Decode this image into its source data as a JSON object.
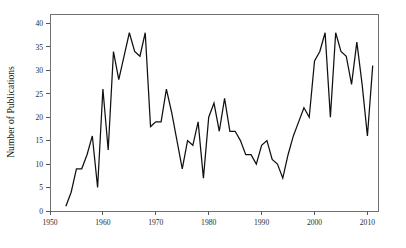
{
  "chart_data": {
    "type": "line",
    "title": "",
    "subtitle": "",
    "xlabel": "",
    "ylabel": "Number of Publications",
    "xlim": [
      1950,
      2012
    ],
    "ylim": [
      0,
      42
    ],
    "xticks": [
      1950,
      1960,
      1970,
      1980,
      1990,
      2000,
      2010
    ],
    "yticks": [
      0,
      5,
      10,
      15,
      20,
      25,
      30,
      35,
      40
    ],
    "xtick_labels": [
      "1950",
      "1960",
      "1970",
      "1980",
      "1990",
      "2000",
      "2010"
    ],
    "ytick_labels": [
      "0",
      "5",
      "10",
      "15",
      "20",
      "25",
      "30",
      "35",
      "40"
    ],
    "grid": false,
    "legend": false,
    "legend_position": "none",
    "line_color": "#101010",
    "series": [
      {
        "name": "Number of Publications",
        "x": [
          1953,
          1954,
          1955,
          1956,
          1957,
          1958,
          1959,
          1960,
          1961,
          1962,
          1963,
          1964,
          1965,
          1966,
          1967,
          1968,
          1969,
          1970,
          1971,
          1972,
          1973,
          1974,
          1975,
          1976,
          1977,
          1978,
          1979,
          1980,
          1981,
          1982,
          1983,
          1984,
          1985,
          1986,
          1987,
          1988,
          1989,
          1990,
          1991,
          1992,
          1993,
          1994,
          1995,
          1996,
          1997,
          1998,
          1999,
          2000,
          2001,
          2002,
          2003,
          2004,
          2005,
          2006,
          2007,
          2008,
          2009,
          2010,
          2011
        ],
        "values": [
          1,
          4,
          9,
          9,
          12,
          16,
          5,
          26,
          13,
          34,
          28,
          33,
          38,
          34,
          33,
          38,
          18,
          19,
          19,
          26,
          21,
          15,
          9,
          15,
          14,
          19,
          7,
          20,
          23,
          17,
          24,
          17,
          17,
          15,
          12,
          12,
          10,
          14,
          15,
          11,
          10,
          7,
          12,
          16,
          19,
          22,
          20,
          32,
          34,
          38,
          20,
          38,
          34,
          33,
          27,
          36,
          27,
          16,
          31
        ]
      }
    ]
  },
  "axes": {
    "y_title": "Number of Publications"
  }
}
